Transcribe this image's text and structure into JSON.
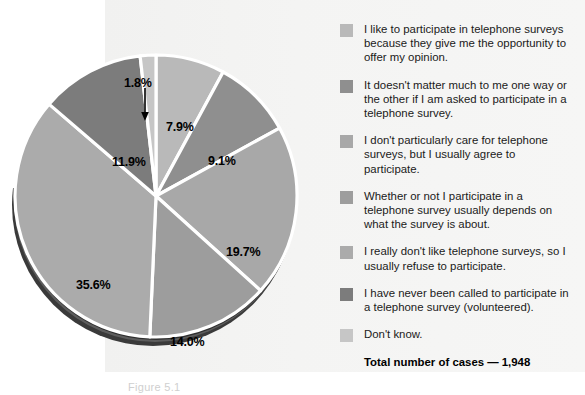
{
  "figure": {
    "caption": "Figure 5.1",
    "total_label": "Total number of cases — 1,948"
  },
  "chart_data": {
    "type": "pie",
    "title": "",
    "subtitle": "",
    "xlabel": "",
    "ylabel": "",
    "legend_position": "right",
    "total_cases": 1948,
    "total_cases_display": "1,948",
    "categories": [
      "I like to participate in telephone surveys because they give me the opportunity to offer my opinion.",
      "It doesn't matter much to me one way or the other if I am asked to participate in a telephone survey.",
      "I don't particularly care for telephone surveys, but I usually agree to participate.",
      "Whether or not I participate in a telephone survey usually depends on what the survey is about.",
      "I really don't like telephone surveys, so I usually refuse to participate.",
      "I have never been called to participate in a telephone survey (volunteered).",
      "Don't know."
    ],
    "values": [
      7.9,
      9.1,
      19.7,
      14.0,
      35.6,
      11.9,
      1.8
    ],
    "value_labels": [
      "7.9%",
      "9.1%",
      "19.7%",
      "14.0%",
      "35.6%",
      "11.9%",
      "1.8%"
    ],
    "colors": [
      "#b9b9b9",
      "#8f8f8f",
      "#a8a8a8",
      "#9d9d9d",
      "#ababab",
      "#7c7c7c",
      "#c6c6c6"
    ]
  },
  "legend": {
    "items": [
      {
        "swatch": "#b9b9b9",
        "label": "I like to participate in telephone surveys because they give me the opportunity to offer my opinion."
      },
      {
        "swatch": "#8f8f8f",
        "label": "It doesn't matter much to me one way or the other if I am asked to participate in a telephone survey."
      },
      {
        "swatch": "#a8a8a8",
        "label": "I don't particularly care for telephone surveys, but I usually agree to participate."
      },
      {
        "swatch": "#9d9d9d",
        "label": "Whether or not I participate in a telephone survey usually depends on what the survey is about."
      },
      {
        "swatch": "#ababab",
        "label": "I really don't like telephone surveys, so I usually refuse to participate."
      },
      {
        "swatch": "#7c7c7c",
        "label": "I have never been called to participate in a telephone survey (volunteered)."
      },
      {
        "swatch": "#c6c6c6",
        "label": "Don't know."
      }
    ]
  },
  "slice_labels": [
    {
      "text": "7.9%",
      "left": 158,
      "top": 82
    },
    {
      "text": "9.1%",
      "left": 200,
      "top": 116
    },
    {
      "text": "19.7%",
      "left": 218,
      "top": 207
    },
    {
      "text": "14.0%",
      "left": 162,
      "top": 297
    },
    {
      "text": "35.6%",
      "left": 68,
      "top": 240
    },
    {
      "text": "11.9%",
      "left": 104,
      "top": 117
    },
    {
      "text": "1.8%",
      "left": 116,
      "top": 38
    }
  ]
}
